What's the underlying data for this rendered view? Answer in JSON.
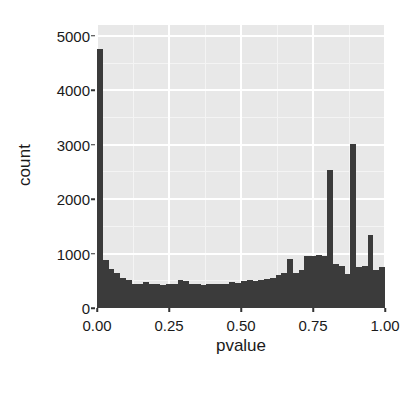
{
  "chart_data": {
    "type": "bar",
    "chart_subtype": "histogram",
    "title": "",
    "xlabel": "pvalue",
    "ylabel": "count",
    "xlim": [
      0.0,
      1.0
    ],
    "ylim": [
      0,
      5200
    ],
    "grid": true,
    "legend": "none",
    "bins": 50,
    "binwidth": 0.02,
    "x_ticks": [
      0.0,
      0.25,
      0.5,
      0.75,
      1.0
    ],
    "x_tick_labels": [
      "0.00",
      "0.25",
      "0.50",
      "0.75",
      "1.00"
    ],
    "y_ticks": [
      0,
      1000,
      2000,
      3000,
      4000,
      5000
    ],
    "y_tick_labels": [
      "0",
      "1000",
      "2000",
      "3000",
      "4000",
      "5000"
    ],
    "bin_centers": [
      0.01,
      0.03,
      0.05,
      0.07,
      0.09,
      0.11,
      0.13,
      0.15,
      0.17,
      0.19,
      0.21,
      0.23,
      0.25,
      0.27,
      0.29,
      0.31,
      0.33,
      0.35,
      0.37,
      0.39,
      0.41,
      0.43,
      0.45,
      0.47,
      0.49,
      0.51,
      0.53,
      0.55,
      0.57,
      0.59,
      0.61,
      0.63,
      0.65,
      0.67,
      0.69,
      0.71,
      0.73,
      0.75,
      0.77,
      0.79,
      0.81,
      0.83,
      0.85,
      0.87,
      0.89,
      0.91,
      0.93,
      0.95,
      0.97,
      0.99
    ],
    "values": [
      4760,
      880,
      720,
      640,
      560,
      510,
      450,
      440,
      470,
      450,
      440,
      430,
      450,
      440,
      520,
      490,
      450,
      440,
      430,
      440,
      450,
      440,
      450,
      470,
      460,
      500,
      520,
      500,
      510,
      540,
      560,
      600,
      640,
      900,
      640,
      700,
      950,
      960,
      980,
      950,
      2530,
      800,
      780,
      620,
      3010,
      760,
      780,
      1350,
      700,
      760
    ],
    "colors": {
      "bar_fill": "#3b3b3b",
      "panel_background": "#e8e8e8",
      "major_grid": "#ffffff",
      "minor_grid": "#f4f4f4",
      "text": "#1a1a1a",
      "figure_background": "#ffffff"
    },
    "notes": {
      "peak_left_label": "4760",
      "peak_right_1_label": "2530",
      "peak_right_2_label": "3010",
      "peak_right_3_label": "1350"
    }
  }
}
